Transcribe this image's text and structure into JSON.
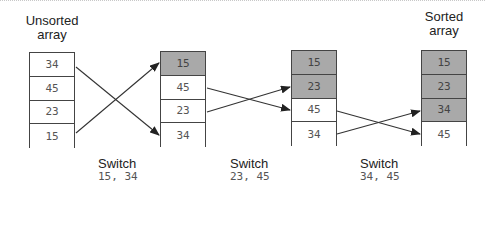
{
  "labels": {
    "unsorted": "Unsorted array",
    "unsorted_line1": "Unsorted",
    "unsorted_line2": "array",
    "sorted_line1": "Sorted",
    "sorted_line2": "array"
  },
  "arrays": [
    {
      "cells": [
        {
          "value": "34",
          "shaded": false
        },
        {
          "value": "45",
          "shaded": false
        },
        {
          "value": "23",
          "shaded": false
        },
        {
          "value": "15",
          "shaded": false
        }
      ]
    },
    {
      "cells": [
        {
          "value": "15",
          "shaded": true
        },
        {
          "value": "45",
          "shaded": false
        },
        {
          "value": "23",
          "shaded": false
        },
        {
          "value": "34",
          "shaded": false
        }
      ]
    },
    {
      "cells": [
        {
          "value": "15",
          "shaded": true
        },
        {
          "value": "23",
          "shaded": true
        },
        {
          "value": "45",
          "shaded": false
        },
        {
          "value": "34",
          "shaded": false
        }
      ]
    },
    {
      "cells": [
        {
          "value": "15",
          "shaded": true
        },
        {
          "value": "23",
          "shaded": true
        },
        {
          "value": "34",
          "shaded": true
        },
        {
          "value": "45",
          "shaded": false
        }
      ]
    }
  ],
  "switches": [
    {
      "title": "Switch",
      "values": "15, 34"
    },
    {
      "title": "Switch",
      "values": "23, 45"
    },
    {
      "title": "Switch",
      "values": "34, 45"
    }
  ],
  "colors": {
    "shaded": "#a9a9a9",
    "border": "#444444",
    "arrow": "#333333"
  }
}
